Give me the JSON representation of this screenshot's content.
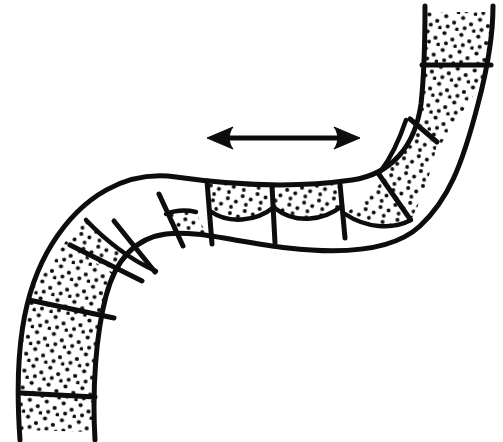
{
  "figure": {
    "background_color": "#ffffff",
    "ink_color": "#0d0d0d",
    "stipple_color": "#0d0d0d",
    "canvas": {
      "width": 503,
      "height": 442
    }
  },
  "annotations": {
    "arrow": {
      "name": "double-headed-arrow",
      "direction": "horizontal-bidirectional",
      "x_start": 207,
      "x_end": 360,
      "y": 138,
      "shaft_thickness": 4,
      "head_length": 22,
      "head_half_width": 11
    }
  },
  "chart_data": {
    "type": "diagram",
    "xlabel": "",
    "ylabel": "",
    "grid": false,
    "legend": "none",
    "xlim": [
      0,
      503
    ],
    "ylim": [
      0,
      442
    ],
    "band": {
      "outer_path": "M 20 430 C 14 352 22 292 52 244 C 82 196 126 170 176 177 C 232 185 296 188 352 180 C 392 174 415 146 421 104 C 425 68 425 34 425 12",
      "inner_path": "M 95 432 C 88 360 96 310 122 272 C 150 232 186 214 232 224 C 292 237 338 242 372 230 C 400 220 418 196 426 150 C 434 104 440 48 448 12",
      "end_cap_top": "M 425 12 L 493 12",
      "end_cap_bottom": "M 20 430 L 95 432",
      "stroke_width": 5
    },
    "septa": [
      {
        "id": "septum-1",
        "path": "M 21 393 L 95 397"
      },
      {
        "id": "septum-2",
        "path": "M 29 300 L 114 318"
      },
      {
        "id": "septum-3",
        "path": "M 70 245 L 142 281"
      },
      {
        "id": "septum-4",
        "path": "M 114 221 L 155 272"
      },
      {
        "id": "septum-5",
        "path": "M 159 194 L 183 246"
      },
      {
        "id": "septum-6",
        "path": "M 207 181 L 212 244"
      },
      {
        "id": "septum-7",
        "path": "M 272 186 L 275 243"
      },
      {
        "id": "septum-8",
        "path": "M 340 184 L 345 238"
      },
      {
        "id": "septum-9",
        "path": "M 378 173 L 410 219"
      },
      {
        "id": "septum-10",
        "path": "M 410 119 L 437 142"
      },
      {
        "id": "septum-11",
        "path": "M 422 65 L 491 65"
      }
    ],
    "segments": [
      {
        "id": "segment-1",
        "position": "bottom-left-end",
        "fill": "full-stipple",
        "stipple_density": "high",
        "region": "M 20 430 L 95 432 L 95 397 L 21 393 Z"
      },
      {
        "id": "segment-2",
        "position": "lower-left",
        "fill": "full-stipple",
        "stipple_density": "high",
        "region": "M 21 393 L 95 397 L 114 318 L 29 300 Z"
      },
      {
        "id": "segment-3",
        "position": "left-curve-outer",
        "fill": "full-stipple",
        "stipple_density": "high",
        "region": "M 29 300 L 114 318 L 142 281 L 70 245 Z"
      },
      {
        "id": "segment-4",
        "position": "left-curve-upper",
        "fill": "partial-stipple-outer",
        "stipple_density": "medium",
        "region": "M 70 245 L 142 281 L 155 272 L 114 221 Z"
      },
      {
        "id": "segment-5",
        "position": "left-ascending",
        "fill": "none",
        "stipple_density": "none",
        "region": "M 114 221 L 155 272 L 183 246 L 159 194 Z"
      },
      {
        "id": "segment-6",
        "position": "left-transition",
        "fill": "partial-stipple-inner",
        "stipple_density": "medium",
        "region": "M 159 194 L 183 246 L 212 244 L 207 181 Z"
      },
      {
        "id": "segment-7",
        "position": "middle-left",
        "fill": "partial-stipple-top",
        "stipple_density": "medium",
        "region": "M 207 181 L 212 244 L 275 243 L 272 186 Z"
      },
      {
        "id": "segment-8",
        "position": "middle-right",
        "fill": "partial-stipple-top",
        "stipple_density": "medium",
        "region": "M 272 186 L 275 243 L 345 238 L 340 184 Z"
      },
      {
        "id": "segment-9",
        "position": "right-transition",
        "fill": "partial-stipple-bottom",
        "stipple_density": "medium",
        "region": "M 340 184 L 345 238 L 410 219 L 378 173 Z"
      },
      {
        "id": "segment-10",
        "position": "right-curve-lower",
        "fill": "partial-stipple-outer",
        "stipple_density": "medium",
        "region": "M 378 173 L 410 219 L 437 142 L 410 119 Z"
      },
      {
        "id": "segment-11",
        "position": "right-curve-upper",
        "fill": "full-stipple",
        "stipple_density": "high",
        "region": "M 410 119 L 437 142 L 491 65 L 422 65 Z"
      },
      {
        "id": "segment-12",
        "position": "top-right-end",
        "fill": "full-stipple",
        "stipple_density": "high",
        "region": "M 422 65 L 491 65 L 493 12 L 425 12 Z"
      }
    ],
    "annotation_arrow": {
      "type": "double-headed",
      "x_start": 207,
      "x_end": 360,
      "y": 138
    }
  }
}
